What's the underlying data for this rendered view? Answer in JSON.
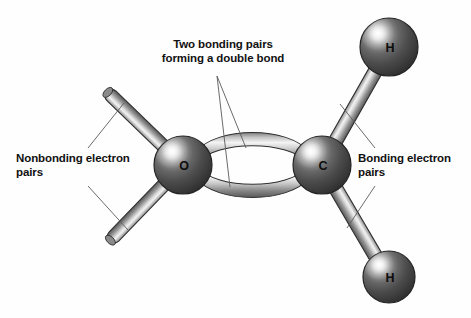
{
  "figure": {
    "background_color": "#fefefe",
    "line_color": "#555555",
    "text_color": "#111111"
  },
  "atoms": [
    {
      "id": "oxygen",
      "symbol": "O",
      "cx": 183,
      "cy": 165,
      "r": 29,
      "color": "#4d4d4d"
    },
    {
      "id": "carbon",
      "symbol": "C",
      "cx": 322,
      "cy": 165,
      "r": 29,
      "color": "#4d4d4d"
    },
    {
      "id": "hydrogen-top",
      "symbol": "H",
      "cx": 389,
      "cy": 47,
      "r": 29,
      "color": "#4d4d4d"
    },
    {
      "id": "hydrogen-bottom",
      "symbol": "H",
      "cx": 389,
      "cy": 277,
      "r": 26,
      "color": "#4d4d4d"
    }
  ],
  "bonds": [
    {
      "id": "double-bond-upper",
      "type": "arc",
      "from": "oxygen",
      "to": "carbon"
    },
    {
      "id": "double-bond-lower",
      "type": "arc",
      "from": "oxygen",
      "to": "carbon"
    },
    {
      "id": "bond-c-h-top",
      "type": "rod",
      "from": "carbon",
      "to": "hydrogen-top"
    },
    {
      "id": "bond-c-h-bottom",
      "type": "rod",
      "from": "carbon",
      "to": "hydrogen-bottom"
    },
    {
      "id": "lone-pair-upper-left",
      "type": "rod",
      "from": "oxygen",
      "to": "free-end"
    },
    {
      "id": "lone-pair-lower-left",
      "type": "rod",
      "from": "oxygen",
      "to": "free-end"
    }
  ],
  "callouts": {
    "double_bond": {
      "line1": "Two bonding pairs",
      "line2": "forming a double bond",
      "leader_count": 2
    },
    "nonbonding": {
      "line1": "Nonbonding electron",
      "line2": "pairs",
      "leader_count": 2
    },
    "bonding": {
      "line1": "Bonding electron",
      "line2": "pairs",
      "leader_count": 2
    }
  }
}
